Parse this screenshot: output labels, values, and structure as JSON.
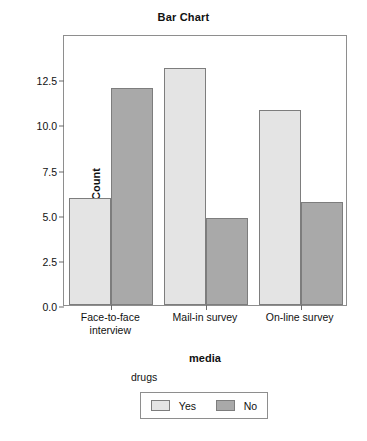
{
  "chart_data": {
    "type": "bar",
    "title": "Bar Chart",
    "xlabel": "media",
    "ylabel": "Count",
    "categories": [
      "Face-to-face\ninterview",
      "Mail-in survey",
      "On-line survey"
    ],
    "series": [
      {
        "name": "Yes",
        "color": "#e4e4e4",
        "values": [
          5.9,
          13.1,
          10.8
        ]
      },
      {
        "name": "No",
        "color": "#a9a9a9",
        "values": [
          12.0,
          4.8,
          5.7
        ]
      }
    ],
    "legend": {
      "title": "drugs",
      "position": "bottom",
      "entries": [
        "Yes",
        "No"
      ]
    },
    "ylim": [
      0,
      15
    ],
    "yticks": [
      0.0,
      2.5,
      5.0,
      7.5,
      10.0,
      12.5
    ],
    "ytick_labels": [
      "0.0",
      "2.5",
      "5.0",
      "7.5",
      "10.0",
      "12.5"
    ],
    "grid": false
  }
}
